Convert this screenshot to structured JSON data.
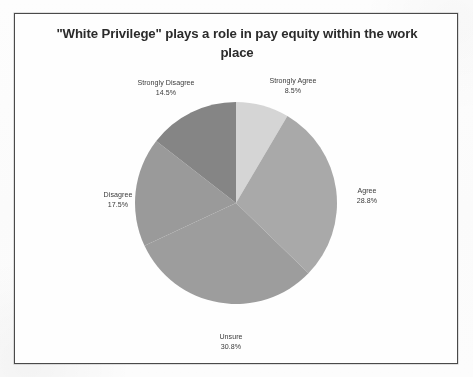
{
  "chart_data": {
    "type": "pie",
    "title": "\"White Privilege\" plays a role in pay equity within the work place",
    "categories": [
      "Strongly Agree",
      "Agree",
      "Unsure",
      "Disagree",
      "Strongly Disagree"
    ],
    "values": [
      8.5,
      28.8,
      30.8,
      17.5,
      14.5
    ],
    "value_suffix": "%",
    "labels": [
      "8.5%",
      "28.8%",
      "30.8%",
      "17.5%",
      "14.5%"
    ],
    "colors": [
      "#d5d5d5",
      "#a9a9a9",
      "#9d9d9d",
      "#9a9a9a",
      "#858585"
    ],
    "legend": "none",
    "grid": false,
    "start_angle_deg": 0,
    "direction": "clockwise",
    "xlabel": "",
    "ylabel": ""
  },
  "chart": {
    "title": "\"White Privilege\" plays a role in pay equity within the work place",
    "slices": [
      {
        "name": "Strongly Agree",
        "pct": "8.5%"
      },
      {
        "name": "Agree",
        "pct": "28.8%"
      },
      {
        "name": "Unsure",
        "pct": "30.8%"
      },
      {
        "name": "Disagree",
        "pct": "17.5%"
      },
      {
        "name": "Strongly Disagree",
        "pct": "14.5%"
      }
    ]
  }
}
